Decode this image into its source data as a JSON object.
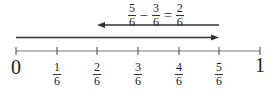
{
  "equation": {
    "a": {
      "num": "5",
      "den": "6"
    },
    "op": "−",
    "b": {
      "num": "3",
      "den": "6"
    },
    "eq": "=",
    "result": {
      "num": "2",
      "den": "6"
    }
  },
  "number_line": {
    "start_label": "0",
    "end_label": "1",
    "ticks": [
      {
        "num": "1",
        "den": "6"
      },
      {
        "num": "2",
        "den": "6"
      },
      {
        "num": "3",
        "den": "6"
      },
      {
        "num": "4",
        "den": "6"
      },
      {
        "num": "5",
        "den": "6"
      }
    ]
  },
  "arrows": [
    {
      "name": "forward-arrow",
      "from": "0",
      "to": "5/6"
    },
    {
      "name": "backward-arrow",
      "from": "5/6",
      "to": "2/6"
    }
  ],
  "colors": {
    "arrow": "#333333",
    "axis": "#666666"
  }
}
